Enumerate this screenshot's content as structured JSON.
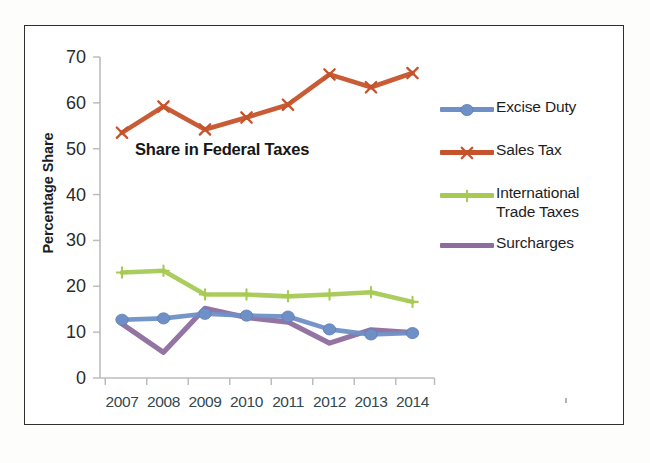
{
  "chart_data": {
    "type": "line",
    "title": "Share in Federal Taxes",
    "xlabel": "",
    "ylabel": "Percentage Share",
    "ylim": [
      0,
      70
    ],
    "ytick_step": 10,
    "yticks": [
      70,
      60,
      50,
      40,
      30,
      20,
      10,
      0
    ],
    "categories": [
      "2007",
      "2008",
      "2009",
      "2010",
      "2011",
      "2012",
      "2013",
      "2014"
    ],
    "grid": false,
    "legend_position": "right",
    "series": [
      {
        "name": "Excise Duty",
        "color": "#6f90c6",
        "marker": "diamond",
        "values": [
          12.7,
          13.0,
          14.0,
          13.6,
          13.4,
          10.6,
          9.5,
          9.8
        ]
      },
      {
        "name": "Sales Tax",
        "color": "#c5532b",
        "marker": "x",
        "values": [
          53.5,
          59.2,
          54.2,
          56.8,
          59.6,
          66.2,
          63.4,
          66.5
        ]
      },
      {
        "name": "International Trade Taxes",
        "color": "#a2c martial",
        "marker": "plus",
        "values": [
          23.0,
          23.4,
          18.2,
          18.2,
          17.8,
          18.2,
          18.7,
          16.6
        ]
      },
      {
        "name": "Surcharges",
        "color": "#8d6d9e",
        "marker": "none",
        "values": [
          11.8,
          5.6,
          15.2,
          13.2,
          12.2,
          7.6,
          10.5,
          9.9
        ]
      }
    ]
  },
  "legend": {
    "items": [
      {
        "label": "Excise Duty",
        "color": "#6f90c6",
        "marker": "diamond"
      },
      {
        "label": "Sales Tax",
        "color": "#c5532b",
        "marker": "x"
      },
      {
        "label": "International Trade Taxes",
        "color": "#a5c martial",
        "marker": "plus"
      },
      {
        "label": "Surcharges",
        "color": "#8d6d9e",
        "marker": "none"
      }
    ]
  },
  "colors": {
    "excise_duty": "#6f90c6",
    "sales_tax": "#c5532b",
    "international_trade_taxes": "#a7ca54",
    "surcharges": "#8d6d9e",
    "axis": "#b9b9b9",
    "x_tick_text": "#33484f",
    "y_tick_text": "#2b2b2b",
    "frame": "#2f2f2f"
  }
}
